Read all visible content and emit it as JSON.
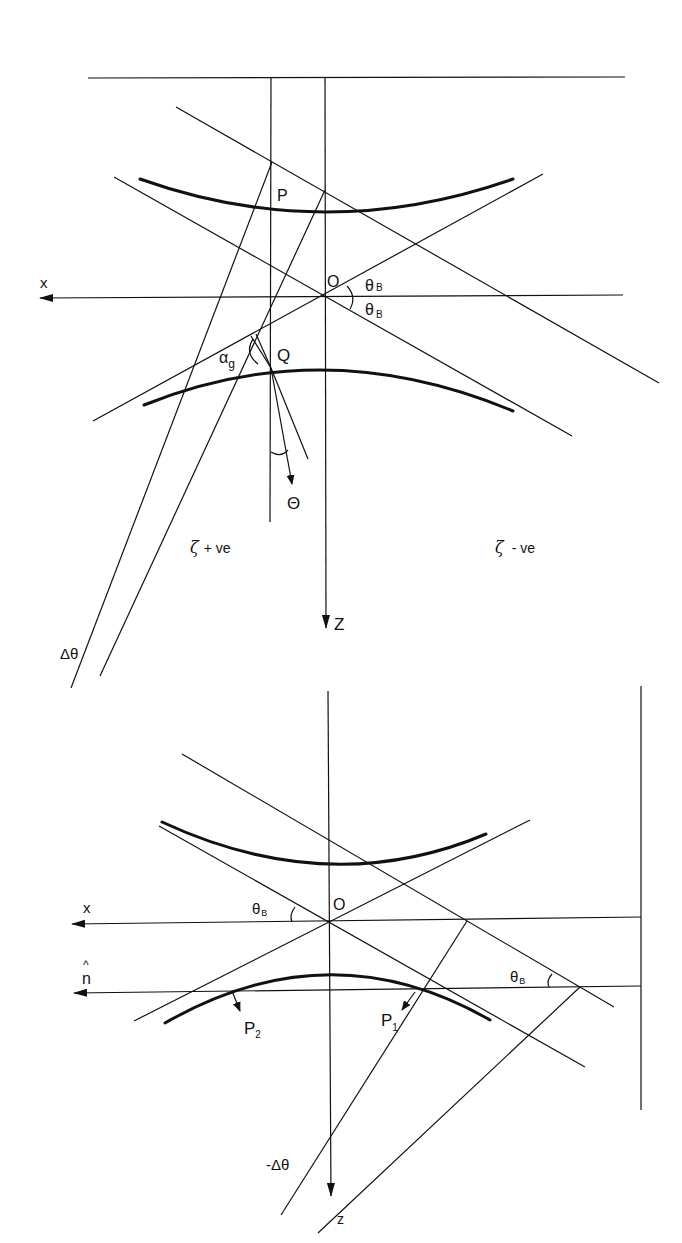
{
  "figure_top": {
    "labels": {
      "x_axis": "x",
      "z_axis": "Z",
      "origin": "O",
      "point_p": "P",
      "point_q": "Q",
      "theta_b_upper": "θ",
      "theta_b_upper_sub": "B",
      "theta_b_lower": "θ",
      "theta_b_lower_sub": "B",
      "alpha_g": "α",
      "alpha_g_sub": "g",
      "big_theta": "Θ",
      "zeta_positive": "ζ",
      "zeta_positive_suffix": "+ ve",
      "zeta_negative": "ζ",
      "zeta_negative_suffix": "- ve",
      "delta_theta": "Δθ"
    }
  },
  "figure_bottom": {
    "labels": {
      "x_axis": "x",
      "n_hat_mark": "^",
      "n_hat": "n",
      "z_axis": "z",
      "origin": "O",
      "theta_b_left": "θ",
      "theta_b_left_sub": "B",
      "theta_b_right": "θ",
      "theta_b_right_sub": "B",
      "point_p1": "P",
      "point_p1_sub": "1",
      "point_p2": "P",
      "point_p2_sub": "2",
      "neg_delta_theta": "-Δθ"
    }
  }
}
